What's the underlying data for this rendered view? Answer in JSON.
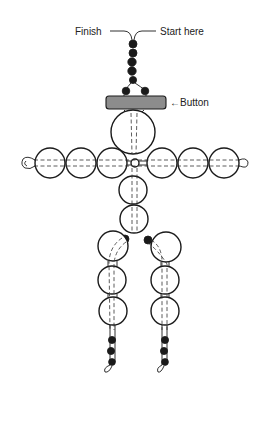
{
  "diagram": {
    "type": "bead-figure-instructions",
    "labels": {
      "finish": "Finish",
      "start": "Start here",
      "button": "←Button"
    },
    "parts": {
      "top_black_beads": 5,
      "neck_black_beads": 2,
      "button_color": "#8c8c8c",
      "head_beads": 1,
      "arm_beads_per_side": 3,
      "body_beads": 2,
      "hip_black_beads": 2,
      "leg_beads_per_side": 3,
      "foot_black_beads_per_side": 3
    }
  }
}
